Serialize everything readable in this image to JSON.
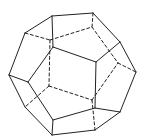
{
  "figure": {
    "stroke_color": "#222222",
    "background": "#ffffff",
    "vertices": {
      "A": [
        52,
        16
      ],
      "B": [
        93,
        13
      ],
      "C": [
        25,
        33
      ],
      "D": [
        120,
        42
      ],
      "E": [
        136,
        72
      ],
      "F": [
        9,
        75
      ],
      "G": [
        53,
        47
      ],
      "H": [
        96,
        62
      ],
      "I": [
        28,
        82
      ],
      "J": [
        95,
        108
      ],
      "K": [
        120,
        112
      ],
      "L": [
        53,
        120
      ],
      "M": [
        52,
        135
      ],
      "N": [
        95,
        130
      ],
      "O": [
        25,
        107
      ],
      "P": [
        50,
        40
      ],
      "Q": [
        92,
        27
      ],
      "R": [
        118,
        63
      ],
      "S": [
        49,
        86
      ],
      "T": [
        92,
        100
      ]
    },
    "visible_edges": [
      [
        "A",
        "B"
      ],
      [
        "A",
        "C"
      ],
      [
        "B",
        "D"
      ],
      [
        "D",
        "E"
      ],
      [
        "C",
        "F"
      ],
      [
        "A",
        "G"
      ],
      [
        "G",
        "H"
      ],
      [
        "H",
        "D"
      ],
      [
        "G",
        "I"
      ],
      [
        "I",
        "F"
      ],
      [
        "H",
        "J"
      ],
      [
        "J",
        "K"
      ],
      [
        "K",
        "E"
      ],
      [
        "J",
        "L"
      ],
      [
        "L",
        "I"
      ],
      [
        "L",
        "M"
      ],
      [
        "M",
        "N"
      ],
      [
        "N",
        "K"
      ],
      [
        "F",
        "O"
      ],
      [
        "O",
        "M"
      ]
    ],
    "hidden_edges": [
      [
        "C",
        "P"
      ],
      [
        "P",
        "Q"
      ],
      [
        "Q",
        "B"
      ],
      [
        "Q",
        "R"
      ],
      [
        "R",
        "E"
      ],
      [
        "P",
        "S"
      ],
      [
        "S",
        "T"
      ],
      [
        "T",
        "R"
      ],
      [
        "S",
        "O"
      ],
      [
        "T",
        "N"
      ]
    ]
  }
}
